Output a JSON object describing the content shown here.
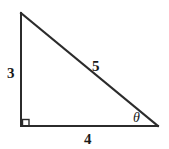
{
  "figure": {
    "name": "right-triangle-3-4-5",
    "background_color": "#ffffff",
    "stroke_color": "#2b2b2b",
    "label_color": "#1a1a1a"
  },
  "labels": {
    "vertical_side": "3",
    "hypotenuse": "5",
    "horizontal_side": "4",
    "angle": "θ"
  },
  "geometry": {
    "top_vertex": {
      "x": 21,
      "y": 13
    },
    "corner_vertex": {
      "x": 21,
      "y": 126
    },
    "right_vertex": {
      "x": 158,
      "y": 126
    },
    "right_angle_marker": {
      "x": 22,
      "y": 119,
      "size": 7
    },
    "stroke_width": 2
  }
}
